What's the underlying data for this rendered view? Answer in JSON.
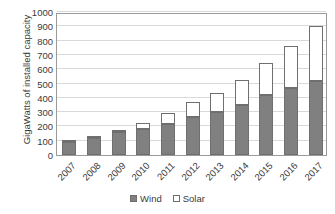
{
  "chart_data": {
    "type": "bar",
    "subtype": "stacked-vertical",
    "title": "",
    "xlabel": "",
    "ylabel": "GigaWatts of installed capacity",
    "ylim": [
      0,
      1000
    ],
    "yticks": [
      0,
      100,
      200,
      300,
      400,
      500,
      600,
      700,
      800,
      900,
      1000
    ],
    "ytick_labels": [
      "0",
      "100",
      "200",
      "300",
      "400",
      "500",
      "600",
      "700",
      "800",
      "900",
      "1000"
    ],
    "grid": true,
    "grid_axis": "y",
    "legend_position": "bottom",
    "categories": [
      "2007",
      "2008",
      "2009",
      "2010",
      "2011",
      "2012",
      "2013",
      "2014",
      "2015",
      "2016",
      "2017"
    ],
    "series": [
      {
        "name": "Wind",
        "color": "#808080",
        "values": [
          94,
          121,
          159,
          181,
          220,
          268,
          300,
          350,
          417,
          467,
          515
        ]
      },
      {
        "name": "Solar",
        "color": "#ffffff",
        "values": [
          9,
          11,
          14,
          40,
          71,
          100,
          135,
          175,
          225,
          295,
          385
        ]
      }
    ],
    "totals": [
      103,
      132,
      173,
      221,
      291,
      368,
      435,
      525,
      642,
      762,
      900
    ]
  },
  "legend": {
    "entries": [
      {
        "label": "Wind",
        "swatch": "filled-gray-square-icon"
      },
      {
        "label": "Solar",
        "swatch": "empty-white-square-icon"
      }
    ]
  },
  "axis": {
    "y_title": "GigaWatts of installed capacity"
  },
  "colors": {
    "wind": "#808080",
    "solar": "#ffffff",
    "bar_outline": "#6f6f6f",
    "gridline": "#d9d9d9",
    "plot_border": "#9a9a9a",
    "text": "#3a3a3a",
    "background": "#ffffff"
  }
}
